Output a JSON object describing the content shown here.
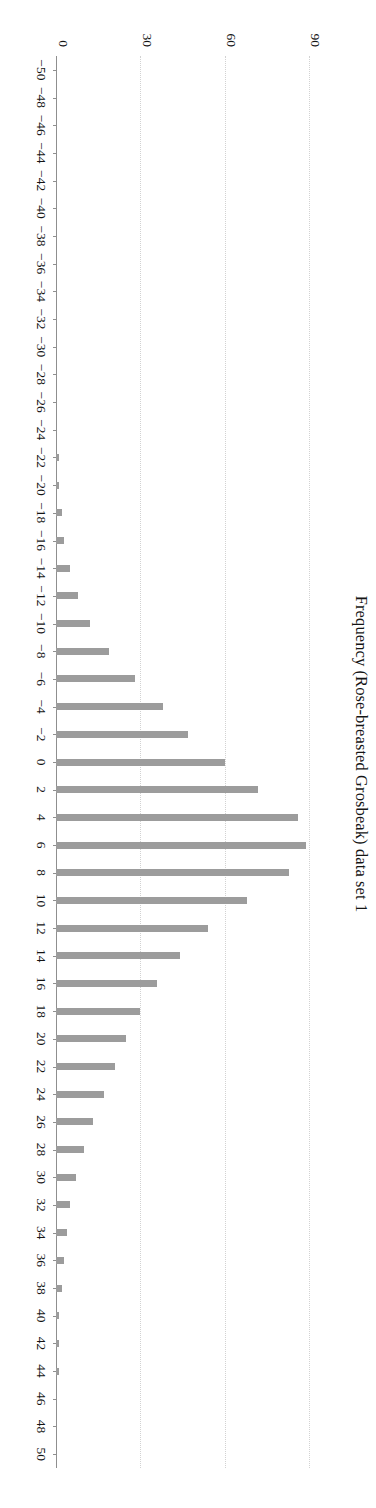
{
  "chart_data": {
    "type": "bar",
    "title": "Frequency (Rose-breasted Grosbeak) data set 1",
    "xlabel": "",
    "ylabel": "",
    "orientation": "vertical-bars-rendered-rotated-90",
    "grid": true,
    "legend": null,
    "xlim": [
      -51,
      51
    ],
    "ylim": [
      0,
      95
    ],
    "xtick_step": 2,
    "ytick_labels": [
      "0",
      "30",
      "60",
      "90"
    ],
    "ytick_values": [
      0,
      30,
      60,
      90
    ],
    "xtick_labels": [
      "−50",
      "−48",
      "−46",
      "−44",
      "−42",
      "−40",
      "−38",
      "−36",
      "−34",
      "−32",
      "−30",
      "−28",
      "−26",
      "−24",
      "−22",
      "−20",
      "−18",
      "−16",
      "−14",
      "−12",
      "−10",
      "−8",
      "−6",
      "−4",
      "−2",
      "0",
      "2",
      "4",
      "6",
      "8",
      "10",
      "12",
      "14",
      "16",
      "18",
      "20",
      "22",
      "24",
      "26",
      "28",
      "30",
      "32",
      "34",
      "36",
      "38",
      "40",
      "42",
      "44",
      "46",
      "48",
      "50"
    ],
    "categories": [
      -50,
      -48,
      -46,
      -44,
      -42,
      -40,
      -38,
      -36,
      -34,
      -32,
      -30,
      -28,
      -26,
      -24,
      -22,
      -20,
      -18,
      -16,
      -14,
      -12,
      -10,
      -8,
      -6,
      -4,
      -2,
      0,
      2,
      4,
      6,
      8,
      10,
      12,
      14,
      16,
      18,
      20,
      22,
      24,
      26,
      28,
      30,
      32,
      34,
      36,
      38,
      40,
      42,
      44,
      46,
      48,
      50
    ],
    "values": [
      0,
      0,
      0,
      0,
      0,
      0,
      0,
      0,
      0,
      0,
      0,
      0,
      0,
      0,
      1,
      1,
      2,
      3,
      5,
      8,
      12,
      19,
      28,
      38,
      47,
      60,
      72,
      86,
      89,
      83,
      68,
      54,
      44,
      36,
      30,
      25,
      21,
      17,
      13,
      10,
      7,
      5,
      4,
      3,
      2,
      1,
      1,
      1,
      0,
      0,
      0
    ],
    "bar_color": "#9c9c9c",
    "grid_color": "#d2d2d2",
    "axis_color": "#8f8f8f",
    "background": "#ffffff",
    "note_max_value": 89,
    "note_max_category": 6
  }
}
